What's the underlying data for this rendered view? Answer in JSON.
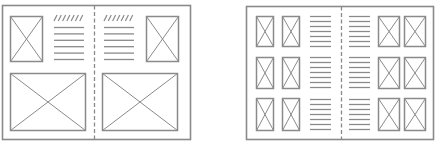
{
  "diagram": {
    "stroke_color": "#8a8a8a",
    "background": "#ffffff",
    "layouts": [
      {
        "name": "two-page-spread-large-images",
        "frame": {
          "x": 2.5,
          "y": 5.5,
          "w": 188,
          "h": 134
        },
        "fold_x": 94.5,
        "hatch": [
          {
            "x": 54,
            "y": 15,
            "w": 30,
            "count": 7
          },
          {
            "x": 104,
            "y": 15,
            "w": 30,
            "count": 7
          }
        ],
        "text_blocks": [
          {
            "x": 54,
            "y": 27,
            "w": 30,
            "lines": 6,
            "spacing": 6.4
          },
          {
            "x": 104,
            "y": 27,
            "w": 30,
            "lines": 6,
            "spacing": 6.4
          }
        ],
        "images": [
          {
            "x": 10.5,
            "y": 16.5,
            "w": 32,
            "h": 45
          },
          {
            "x": 146.5,
            "y": 16.5,
            "w": 32,
            "h": 45
          },
          {
            "x": 10.5,
            "y": 73.5,
            "w": 75,
            "h": 57
          },
          {
            "x": 102.5,
            "y": 73.5,
            "w": 75,
            "h": 57
          }
        ]
      },
      {
        "name": "two-page-spread-grid",
        "frame": {
          "x": 246.5,
          "y": 6.5,
          "w": 187,
          "h": 133
        },
        "fold_x": 341.5,
        "hatch": [],
        "text_blocks": [
          {
            "x": 310,
            "y": 16,
            "w": 21,
            "lines": 7,
            "spacing": 5
          },
          {
            "x": 349,
            "y": 16,
            "w": 21,
            "lines": 7,
            "spacing": 5
          },
          {
            "x": 310,
            "y": 57,
            "w": 21,
            "lines": 7,
            "spacing": 5
          },
          {
            "x": 349,
            "y": 57,
            "w": 21,
            "lines": 7,
            "spacing": 5
          },
          {
            "x": 310,
            "y": 99,
            "w": 21,
            "lines": 7,
            "spacing": 5
          },
          {
            "x": 349,
            "y": 99,
            "w": 21,
            "lines": 7,
            "spacing": 5
          }
        ],
        "images": [
          {
            "x": 256.5,
            "y": 16.5,
            "w": 17,
            "h": 30
          },
          {
            "x": 282.5,
            "y": 16.5,
            "w": 17,
            "h": 30
          },
          {
            "x": 378.5,
            "y": 16.5,
            "w": 21,
            "h": 30
          },
          {
            "x": 404.5,
            "y": 16.5,
            "w": 21,
            "h": 30
          },
          {
            "x": 256.5,
            "y": 57.5,
            "w": 17,
            "h": 31
          },
          {
            "x": 282.5,
            "y": 57.5,
            "w": 17,
            "h": 31
          },
          {
            "x": 378.5,
            "y": 57.5,
            "w": 21,
            "h": 31
          },
          {
            "x": 404.5,
            "y": 57.5,
            "w": 21,
            "h": 31
          },
          {
            "x": 256.5,
            "y": 98.5,
            "w": 17,
            "h": 32
          },
          {
            "x": 282.5,
            "y": 98.5,
            "w": 17,
            "h": 32
          },
          {
            "x": 378.5,
            "y": 98.5,
            "w": 21,
            "h": 32
          },
          {
            "x": 404.5,
            "y": 98.5,
            "w": 21,
            "h": 32
          }
        ]
      }
    ]
  }
}
